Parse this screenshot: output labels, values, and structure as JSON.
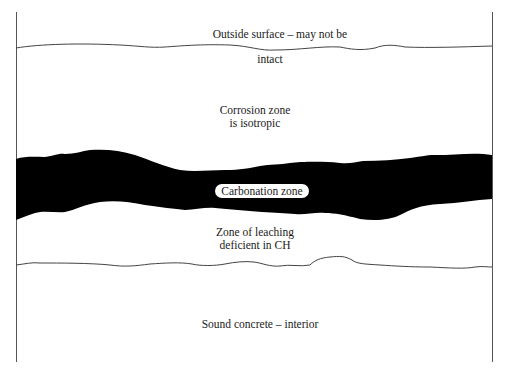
{
  "diagram": {
    "type": "cross-section",
    "colors": {
      "background": "#ffffff",
      "line": "#444444",
      "carbonation_fill": "#000000",
      "text": "#1a1a1a"
    },
    "labels": {
      "outside_surface_line1": "Outside surface – may not be",
      "outside_surface_line2": "intact",
      "corrosion_line1": "Corrosion zone",
      "corrosion_line2": "is isotropic",
      "carbonation": "Carbonation zone",
      "leaching_line1": "Zone of leaching",
      "leaching_line2": "deficient in CH",
      "sound": "Sound concrete – interior"
    },
    "zones": [
      "Outside surface",
      "Corrosion zone",
      "Carbonation zone",
      "Zone of leaching",
      "Sound concrete"
    ]
  }
}
